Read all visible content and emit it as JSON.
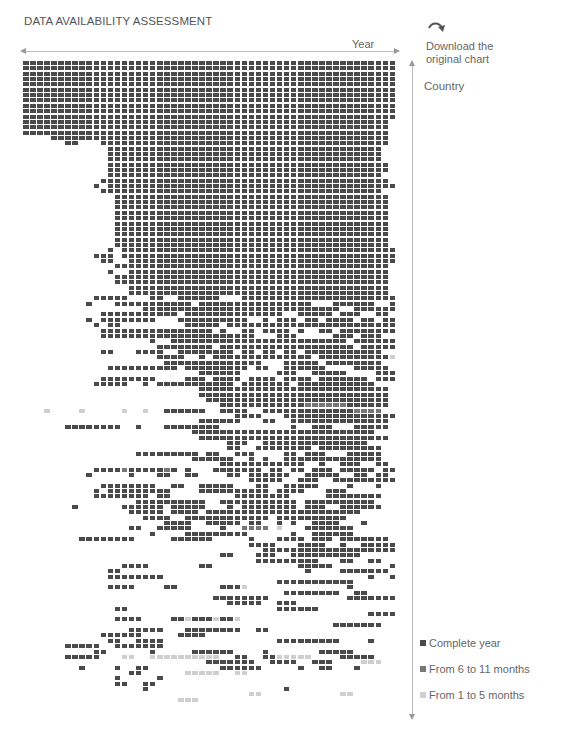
{
  "header": {
    "title": "DATA AVAILABILITY ASSESSMENT",
    "download_line1": "Download the",
    "download_line2": "original chart",
    "download_icon": "curved-arrow-icon"
  },
  "colors": {
    "complete": "#4a4a4a",
    "partial_6_11": "#777777",
    "partial_1_5": "#cfcfcf",
    "axis": "#bbbbbb",
    "text": "#666666"
  },
  "chart_data": {
    "type": "heatmap",
    "title": "DATA AVAILABILITY ASSESSMENT",
    "xlabel": "Year",
    "ylabel": "Country",
    "x_direction": "left-to-right (time)",
    "y_direction": "top-to-bottom (countries, sorted by availability)",
    "grid": false,
    "legend_position": "bottom-right",
    "legend": [
      {
        "key": "#",
        "label": "Complete year",
        "color": "#4a4a4a"
      },
      {
        "key": "+",
        "label": "From 6 to 11 months",
        "color": "#777777"
      },
      {
        "key": ".",
        "label": "From 1 to 5 months",
        "color": "#cfcfcf"
      }
    ],
    "columns": 53,
    "encoding": "each row string has 53 chars; '#'=complete year, '+'=6-11 months, '.'=1-5 months, ' '=no data",
    "rows": [
      "#####################################################",
      "#####################################################",
      "#####################################################",
      "#####################################################",
      "#####################################################",
      "#####################################################",
      "#####################################################",
      "#####################################################",
      "#####################################################",
      "#####################################################",
      "#####################################################",
      "####################################################",
      "####################################################",
      "####################################################",
      "    ################################################",
      "      ##   #########################################",
      "            #######################################  ",
      "            #######################################  ",
      "            #######################################  ",
      "            ######################################## ",
      "            ######################################## ",
      "            #######################################  ",
      "           #########################################",
      "          # #########################################",
      "           ######################################## ",
      "             #######################################",
      "             #######################################",
      "             #######################################",
      "             #######################################",
      "             #######################################",
      "             #######################################",
      "             #######################################",
      "             #######################################",
      "             #######################################",
      "             #######################################",
      "            # #######################################",
      "          ### #######################################",
      "           ##  ######################################",
      "             #######################################",
      "            #  #####################################",
      "             ####################################### ",
      "             ####################################### ",
      "               #####################################",
      "               #####################################",
      "          #####   ##  ######   ######################",
      "         #   ########### ################   ######  #",
      "                 ############################  ######",
      "           ########### ##############  ##### ###  ## ",
      "         # ########   ##########  # ### ## #### ## ##",
      "          # ##         ##### ######################## ",
      "           ################ #  ## #### #  ## ########",
      "           ######################   ###     ### ###  ",
      "                  #  ######################### ######",
      "                   ######## ################### #####",
      "           ##   ####  ######## ## ## ## ###########",
      "                   ####  # ############## ##########.",
      "                    ##############   ##### ########",
      "            ########## ######### ##  ######    #####",
      "                         ######     ###  #####    ###",
      "           ########    ### #### #### #### ####### ###",
      "          #####  # ########### ####### ###########   ",
      "                         ###########################",
      "                         ###########################",
      "                          ##########################",
      "                            ############++++++######",
      "   .    .     .  .  ######  ####  #############++++",
      "                              ####   ################",
      "                         ######   ##  ##############",
      "      ########  #   ########          #  ###   #####",
      "                        ##########################",
      "                         ###########################",
      "                             ###  ###############   ",
      "                             ##  ######## ######### ",
      "                ######### ##  ###    ## ###   #####",
      "                        ######  # #  ##############",
      "                            ############  #  ###  ##",
      "          ####+#####+# #   ####### ## ## ### ##### ##",
      "         #     #   ##  ##    ## ######  #####  ## ##",
      "                                #####  ###  #########",
      "           ########  ##  #####   ##  #####    #   #  ",
      "          # #########    ########## ####   ###    ",
      "          ######## ##         ########     ########",
      "                ##########  ########### ##########",
      "       #      ###### #####   # ######## ###  ######",
      "               ##### #### ######################",
      "                 ####  ############ ##########  ",
      "                    ####  ##### ##  # #  ####   #",
      "               ##  #####    #  ++++ .   #######  ",
      "                  #    #########      #  ######  ",
      "        ########     ######     #   #### ### #######",
      "                                ####   ####  #  ###### ",
      "                                  ########################",
      "                            ##   ###  ##########",
      "                                 #########   ##  ##",
      "              ####       ##            #####        #",
      "            ##                          #    #######",
      "            ########                             #  ##",
      "                                    ###########",
      "            ####    ##      ###.              #",
      "                                     ########  ##",
      "                           ########           ########",
      "                             #####  ###",
      "             ##                     ######",
      "                                                 #######",
      "             ####    ##.###.##.              ",
      "                                            #######",
      "               #####   ########  ##               ",
      "           ######     ####                         ",
      "            ##  ####                #########    #",
      "      #####  #######                             ",
      "          ##      #     ######    #       #####",
      "      #####   ..  ..........  ##  ##.....    #####",
      "                          #######  ####  ###    ...",
      "        #    #  ##          ######     #  ##   #",
      "               ##      .....  ..                ",
      "             #     #                             ",
      "             ##  ##                              ",
      "                 #                   #           ",
      "                                ..           ..  ",
      "                      ...                        "
    ]
  },
  "axis": {
    "x_label": "Year",
    "y_label": "Country"
  },
  "legend": {
    "items": [
      {
        "label": "Complete year",
        "color": "#4a4a4a"
      },
      {
        "label": "From 6 to 11 months",
        "color": "#777777"
      },
      {
        "label": "From 1 to 5 months",
        "color": "#cfcfcf"
      }
    ]
  }
}
